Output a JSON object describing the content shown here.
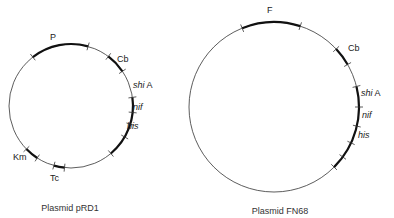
{
  "plasmids": [
    {
      "id": "pRD1",
      "caption": "Plasmid pRD1",
      "circle": {
        "cx": 71,
        "cy": 106,
        "r": 62
      },
      "caption_pos": {
        "x": 70,
        "y": 203
      },
      "thick_arcs": [
        [
          -38,
          16
        ],
        [
          37,
          56
        ],
        [
          82,
          140
        ],
        [
          213,
          226
        ],
        [
          186,
          196
        ]
      ],
      "ticks": [
        -38,
        16,
        37,
        56,
        82,
        96,
        107,
        120,
        140,
        186,
        196,
        213,
        226
      ],
      "genes": [
        {
          "label": "P",
          "italic": false,
          "x": 50,
          "y": 33
        },
        {
          "label": "Cb",
          "italic": false,
          "x": 117,
          "y": 55
        },
        {
          "label": "shi A",
          "italic": true,
          "italic_part": "shi",
          "plain_part": " A",
          "x": 133,
          "y": 81
        },
        {
          "label": "nif",
          "italic": true,
          "x": 133,
          "y": 103
        },
        {
          "label": "his",
          "italic": true,
          "x": 127,
          "y": 122
        },
        {
          "label": "Km",
          "italic": false,
          "x": 13,
          "y": 153
        },
        {
          "label": "Tc",
          "italic": false,
          "x": 50,
          "y": 174
        }
      ]
    },
    {
      "id": "FN68",
      "caption": "Plasmid FN68",
      "circle": {
        "cx": 274,
        "cy": 107,
        "r": 85
      },
      "caption_pos": {
        "x": 280,
        "y": 206
      },
      "thick_arcs": [
        [
          -22,
          18
        ],
        [
          47,
          60
        ],
        [
          76,
          135
        ]
      ],
      "ticks": [
        -22,
        18,
        47,
        60,
        76,
        90,
        103,
        115,
        126,
        135
      ],
      "genes": [
        {
          "label": "F",
          "italic": false,
          "x": 267,
          "y": 6
        },
        {
          "label": "Cb",
          "italic": false,
          "x": 348,
          "y": 44
        },
        {
          "label": "shi A",
          "italic": true,
          "italic_part": "shi",
          "plain_part": " A",
          "x": 361,
          "y": 89
        },
        {
          "label": "nif",
          "italic": true,
          "x": 362,
          "y": 111
        },
        {
          "label": "his",
          "italic": true,
          "x": 358,
          "y": 131
        }
      ]
    }
  ],
  "style": {
    "line_color": "#333333",
    "thin_width": 0.8,
    "thick_width": 2.2
  }
}
